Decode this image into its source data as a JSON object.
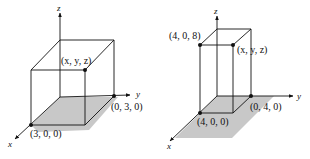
{
  "figures": [
    {
      "id": "cube",
      "axes": {
        "x": "x",
        "y": "y",
        "z": "z"
      },
      "points": [
        {
          "label": "(x, y, z)",
          "role": "top-vertex"
        },
        {
          "label": "(0, 3, 0)",
          "role": "y-axis-vertex"
        },
        {
          "label": "(3, 0, 0)",
          "role": "x-axis-vertex"
        }
      ],
      "base_fill": "#c8c8c8"
    },
    {
      "id": "rectangular-box",
      "axes": {
        "x": "x",
        "y": "y",
        "z": "z"
      },
      "points": [
        {
          "label": "(4, 0, 8)",
          "role": "top-front-vertex"
        },
        {
          "label": "(x, y, z)",
          "role": "top-vertex"
        },
        {
          "label": "(0, 4, 0)",
          "role": "y-axis-vertex"
        },
        {
          "label": "(4, 0, 0)",
          "role": "x-axis-vertex"
        }
      ],
      "base_fill": "#c8c8c8"
    }
  ]
}
